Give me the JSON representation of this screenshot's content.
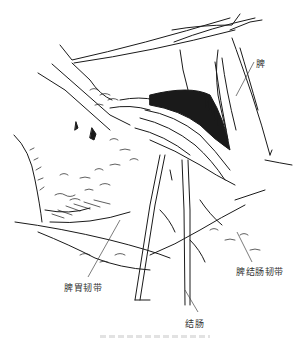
{
  "figure": {
    "type": "surgical-line-illustration",
    "labels": {
      "spleen": "脾",
      "splenocolic_ligament": "脾结肠韧带",
      "gastrosplenic_ligament": "脾胃韧带",
      "colon": "结肠"
    },
    "ink_color": "#1a1a1a",
    "leader_color": "#444444"
  }
}
